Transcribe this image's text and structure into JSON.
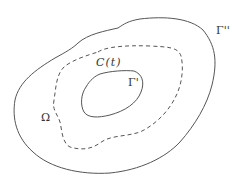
{
  "diagram": {
    "labels": {
      "outer_boundary": "Γ''",
      "curve": "C(t)",
      "inner_boundary": "Γ'",
      "domain": "Ω"
    },
    "colors": {
      "stroke": "#555555",
      "text": "#333333",
      "background": "#ffffff"
    },
    "curves": [
      {
        "name": "outer-boundary",
        "style": "solid"
      },
      {
        "name": "dashed-curve",
        "style": "dashed"
      },
      {
        "name": "inner-boundary",
        "style": "solid"
      }
    ]
  }
}
